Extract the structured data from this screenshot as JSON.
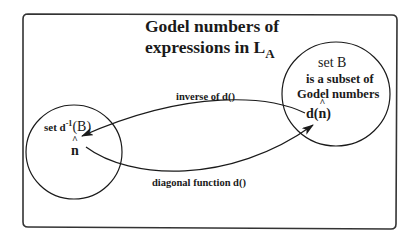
{
  "diagram": {
    "title_line1": "Godel numbers of",
    "title_line2_prefix": "expressions in L",
    "title_line2_subscript": "A",
    "set_b": {
      "label": "set B",
      "line2": "is a subset of",
      "line3": "Godel numbers",
      "element_prefix": "d(",
      "element_var": "n",
      "element_suffix": ")"
    },
    "set_dinv": {
      "label_prefix": "set d",
      "label_sup": "-1",
      "label_suffix": "(B)",
      "element_var": "n"
    },
    "arrows": {
      "inverse_label": "inverse of d()",
      "diagonal_label": "diagonal function d()"
    },
    "colors": {
      "stroke": "#1a1a1a",
      "background": "#ffffff",
      "frame": "#333333"
    }
  }
}
